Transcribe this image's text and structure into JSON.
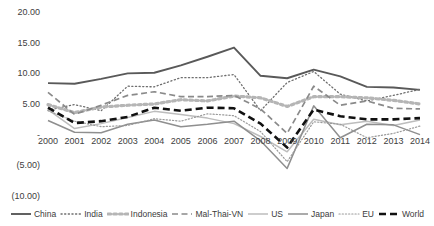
{
  "chart_data": {
    "type": "line",
    "title": "",
    "xlabel": "",
    "ylabel": "",
    "x": [
      2000,
      2001,
      2002,
      2003,
      2004,
      2005,
      2006,
      2007,
      2008,
      2009,
      2010,
      2011,
      2012,
      2013,
      2014
    ],
    "categories": [
      "2000",
      "2001",
      "2002",
      "2003",
      "2004",
      "2005",
      "2006",
      "2007",
      "2008",
      "2009",
      "2010",
      "2011",
      "2012",
      "2013",
      "2014"
    ],
    "ylim": [
      -10.0,
      20.0
    ],
    "ytick_values": [
      20.0,
      15.0,
      10.0,
      5.0,
      0.0,
      -5.0,
      -10.0
    ],
    "ytick_labels": [
      "20.00",
      "15.00",
      "10.00",
      "5.00",
      "-",
      "(5.00)",
      "(10.00)"
    ],
    "grid": false,
    "legend_position": "bottom",
    "series": [
      {
        "name": "China",
        "style": "solid",
        "color": "#595959",
        "width": 1.9,
        "values": [
          8.4,
          8.3,
          9.1,
          10.0,
          10.1,
          11.3,
          12.7,
          14.2,
          9.6,
          9.2,
          10.6,
          9.5,
          7.8,
          7.7,
          7.3
        ]
      },
      {
        "name": "India",
        "style": "dotted",
        "color": "#6e6e6e",
        "width": 1.3,
        "values": [
          4.0,
          4.9,
          3.9,
          7.9,
          7.8,
          9.3,
          9.3,
          9.8,
          3.9,
          8.5,
          10.3,
          6.6,
          5.5,
          6.4,
          7.4
        ]
      },
      {
        "name": "Indonesia",
        "style": "dotted-thick",
        "color": "#b5b5b5",
        "width": 3.2,
        "values": [
          4.9,
          3.6,
          4.5,
          4.8,
          5.0,
          5.7,
          5.5,
          6.3,
          6.0,
          4.6,
          6.2,
          6.2,
          6.0,
          5.6,
          5.0
        ]
      },
      {
        "name": "Mal-Thai-VN",
        "style": "dashed",
        "color": "#8a8a8a",
        "width": 1.7,
        "values": [
          6.9,
          3.3,
          4.8,
          6.4,
          7.0,
          6.2,
          6.2,
          6.4,
          4.2,
          0.2,
          7.9,
          4.8,
          5.5,
          4.3,
          4.2
        ]
      },
      {
        "name": "US",
        "style": "solid",
        "color": "#bdbdbd",
        "width": 1.5,
        "values": [
          4.1,
          1.0,
          1.8,
          2.8,
          3.8,
          3.3,
          2.7,
          1.8,
          -0.3,
          -2.8,
          2.5,
          1.6,
          2.2,
          1.5,
          2.4
        ]
      },
      {
        "name": "Japan",
        "style": "solid",
        "color": "#8f8f8f",
        "width": 1.5,
        "values": [
          2.3,
          0.4,
          0.3,
          1.7,
          2.4,
          1.3,
          1.7,
          2.2,
          -1.0,
          -5.5,
          4.7,
          -0.5,
          1.7,
          1.6,
          0.0
        ]
      },
      {
        "name": "EU",
        "style": "fine-dotted",
        "color": "#9a9a9a",
        "width": 1.2,
        "values": [
          3.9,
          2.2,
          1.3,
          1.5,
          2.6,
          2.2,
          3.4,
          3.1,
          0.5,
          -4.4,
          2.1,
          1.7,
          -0.5,
          0.2,
          1.4
        ]
      },
      {
        "name": "World",
        "style": "bold-dashed",
        "color": "#111111",
        "width": 2.6,
        "values": [
          4.4,
          1.9,
          2.2,
          2.9,
          4.4,
          3.9,
          4.4,
          4.3,
          1.8,
          -2.1,
          4.1,
          3.0,
          2.5,
          2.5,
          2.7
        ]
      }
    ]
  },
  "axis": {
    "y_labels": [
      "20.00",
      "15.00",
      "10.00",
      "5.00",
      "-",
      "(5.00)",
      "(10.00)"
    ],
    "x_labels": [
      "2000",
      "2001",
      "2002",
      "2003",
      "2004",
      "2005",
      "2006",
      "2007",
      "2008",
      "2009",
      "2010",
      "2011",
      "2012",
      "2013",
      "2014"
    ]
  },
  "legend": {
    "items": [
      {
        "label": "China"
      },
      {
        "label": "India"
      },
      {
        "label": "Indonesia"
      },
      {
        "label": "Mal-Thai-VN"
      },
      {
        "label": "US"
      },
      {
        "label": "Japan"
      },
      {
        "label": "EU"
      },
      {
        "label": "World"
      }
    ]
  }
}
